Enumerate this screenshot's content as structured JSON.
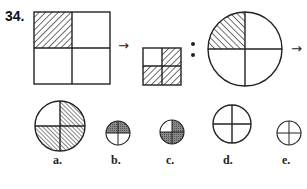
{
  "question": {
    "number": "34.",
    "sequence": [
      {
        "shape": "square",
        "hatched_quadrants": [
          "top-left"
        ],
        "hatch": "forward"
      },
      {
        "symbol": "→"
      },
      {
        "shape": "square",
        "size": "small",
        "hatched_quadrants": [
          "top-right",
          "bottom-left",
          "bottom-right"
        ],
        "hatch": "forward"
      },
      {
        "symbol": ":"
      },
      {
        "shape": "circle",
        "hatched_quadrants": [
          "top-left"
        ],
        "hatch": "backward"
      },
      {
        "symbol": "→"
      }
    ],
    "arrow1": "→",
    "colon": ":",
    "arrow2": "→"
  },
  "options": [
    {
      "label": "a.",
      "size": "large",
      "hatched_quadrants": [
        "top-right",
        "bottom-left",
        "bottom-right"
      ],
      "hatch": "backward"
    },
    {
      "label": "b.",
      "size": "small",
      "hatched_quadrants": [
        "top-left",
        "top-right"
      ],
      "hatch": "dense"
    },
    {
      "label": "c.",
      "size": "small",
      "hatched_quadrants": [
        "top-right",
        "bottom-left",
        "bottom-right"
      ],
      "hatch": "dense"
    },
    {
      "label": "d.",
      "size": "large",
      "hatched_quadrants": [],
      "hatch": "none"
    },
    {
      "label": "e.",
      "size": "small",
      "hatched_quadrants": [],
      "hatch": "none"
    }
  ]
}
